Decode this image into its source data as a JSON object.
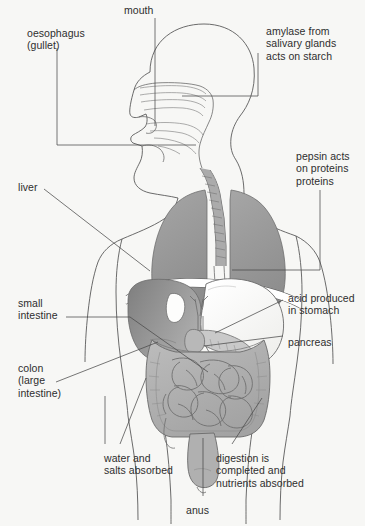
{
  "diagram": {
    "background_color": "#f7f7f5",
    "line_color": "#4a4a4a",
    "text_color": "#2e2e2e",
    "organ_colors": {
      "lung": "#9a9a9a",
      "liver": "#8f8f8f",
      "stomach": "#fbfbfa",
      "intestine": "#b3b3b3",
      "colon": "#a8a8a8",
      "trachea": "#9e9e9e",
      "pancreas": "#c2c2c2",
      "body_outline": "#5a5a5a"
    }
  },
  "labels": {
    "mouth": "mouth",
    "oesophagus": "oesophagus\n(gullet)",
    "amylase": "amylase from\nsalivary glands\nacts on starch",
    "pepsin": "pepsin acts\non proteins\nproteins",
    "liver": "liver",
    "small_intestine": "small\nintestine",
    "colon": "colon\n(large\nintestine)",
    "acid": "acid produced\nin stomach",
    "pancreas": "pancreas",
    "water_salts": "water and\nsalts absorbed",
    "digestion": "digestion is\ncompleted and\nnutrients absorbed",
    "anus": "anus"
  }
}
